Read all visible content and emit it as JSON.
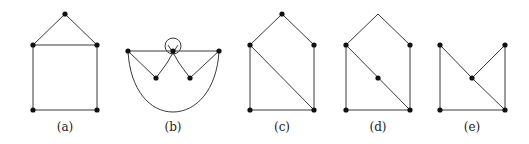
{
  "figure": {
    "panels": [
      {
        "id": "a",
        "label": "(a)",
        "label_pos": [
          65,
          131
        ],
        "vertices": [
          [
            65,
            14
          ],
          [
            33,
            45
          ],
          [
            97,
            45
          ],
          [
            33,
            110
          ],
          [
            97,
            110
          ]
        ],
        "hidden_vertices": [],
        "edges": [
          [
            0,
            1
          ],
          [
            0,
            2
          ],
          [
            1,
            2
          ],
          [
            1,
            3
          ],
          [
            2,
            4
          ],
          [
            3,
            4
          ]
        ],
        "curves": []
      },
      {
        "id": "b",
        "label": "(b)",
        "label_pos": [
          173,
          131
        ],
        "vertices": [
          [
            128,
            51
          ],
          [
            173,
            51
          ],
          [
            219,
            51
          ],
          [
            156,
            78
          ],
          [
            190,
            78
          ]
        ],
        "hidden_vertices": [],
        "edges": [
          [
            0,
            1
          ],
          [
            1,
            2
          ],
          [
            0,
            3
          ],
          [
            2,
            4
          ]
        ],
        "curves": [
          "M 156 78 L 167 63 Q 173 52 178 45",
          "M 190 78 L 179 63 Q 173 52 168 45",
          "M 128 51 C 130 90 150 112 173 112 C 196 112 217 90 219 51"
        ],
        "loop": {
          "cx": 173,
          "cy": 46,
          "r": 8
        }
      },
      {
        "id": "c",
        "label": "(c)",
        "label_pos": [
          282,
          131
        ],
        "vertices": [
          [
            282,
            14
          ],
          [
            250,
            45
          ],
          [
            314,
            45
          ],
          [
            250,
            110
          ],
          [
            314,
            110
          ]
        ],
        "hidden_vertices": [],
        "edges": [
          [
            0,
            1
          ],
          [
            0,
            2
          ],
          [
            1,
            3
          ],
          [
            2,
            4
          ],
          [
            3,
            4
          ],
          [
            1,
            4
          ]
        ],
        "curves": []
      },
      {
        "id": "d",
        "label": "(d)",
        "label_pos": [
          378,
          131
        ],
        "vertices": [
          [
            346,
            45
          ],
          [
            410,
            45
          ],
          [
            378,
            78
          ],
          [
            346,
            110
          ],
          [
            410,
            110
          ]
        ],
        "hidden_vertices": [
          [
            378,
            14
          ]
        ],
        "edges_coords": [
          [
            [
              378,
              14
            ],
            [
              346,
              45
            ]
          ],
          [
            [
              378,
              14
            ],
            [
              410,
              45
            ]
          ],
          [
            [
              346,
              45
            ],
            [
              346,
              110
            ]
          ],
          [
            [
              410,
              45
            ],
            [
              410,
              110
            ]
          ],
          [
            [
              346,
              110
            ],
            [
              410,
              110
            ]
          ],
          [
            [
              346,
              45
            ],
            [
              410,
              110
            ]
          ]
        ],
        "curves": []
      },
      {
        "id": "e",
        "label": "(e)",
        "label_pos": [
          472,
          131
        ],
        "vertices": [
          [
            440,
            45
          ],
          [
            505,
            45
          ],
          [
            472,
            78
          ],
          [
            440,
            110
          ],
          [
            505,
            110
          ]
        ],
        "hidden_vertices": [],
        "edges": [
          [
            0,
            3
          ],
          [
            0,
            2
          ],
          [
            2,
            4
          ],
          [
            1,
            2
          ],
          [
            1,
            4
          ],
          [
            3,
            4
          ]
        ],
        "curves": []
      }
    ]
  }
}
